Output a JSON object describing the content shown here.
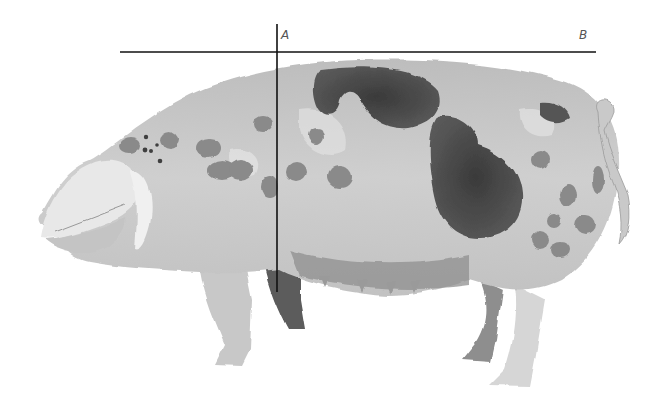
{
  "illustration": {
    "subject": "spotted pig (watercolor, grayscale)",
    "style": "watercolor",
    "palette": {
      "background": "#ffffff",
      "body_light": "#d4d4d4",
      "body_mid": "#b8b8b8",
      "spots": "#8a8a8a",
      "spots_dark": "#4a4a4a",
      "snout": "#e6e6e6",
      "line": "#111111"
    }
  },
  "reference_lines": {
    "horizontal": {
      "from": [
        120,
        52
      ],
      "to": [
        596,
        52
      ],
      "label_start": "A",
      "label_end": "B"
    },
    "vertical": {
      "x": 277,
      "from_y": 24,
      "to_y": 292
    }
  },
  "labels": {
    "a": "A",
    "b": "B"
  }
}
